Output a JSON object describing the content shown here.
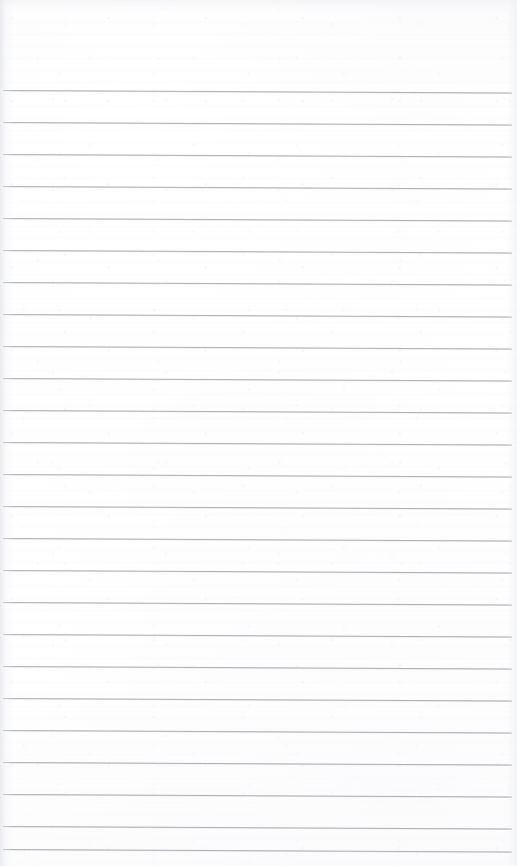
{
  "document": {
    "kind": "scanned-paper",
    "title": "Blank Lined Notebook Page",
    "description": "Scan of an empty ruled notebook page with no handwriting or printed text",
    "page_width": 517,
    "page_height": 866,
    "content_text": "",
    "paper_color": "#fefefe",
    "rule_color": "#9ea2a8",
    "edge_shadow_color": "#e4e5e9"
  },
  "ruling": {
    "line_count": 24,
    "first_line_y": 90,
    "line_spacing": 32,
    "line_thickness": 1,
    "line_left_x": 3,
    "line_right_x": 512,
    "slope_degrees": 0.28,
    "lines": [
      {
        "index": 1,
        "y": 90,
        "x1": 3,
        "x2": 512
      },
      {
        "index": 2,
        "y": 122,
        "x1": 3,
        "x2": 512
      },
      {
        "index": 3,
        "y": 154,
        "x1": 3,
        "x2": 512
      },
      {
        "index": 4,
        "y": 186,
        "x1": 3,
        "x2": 512
      },
      {
        "index": 5,
        "y": 218,
        "x1": 3,
        "x2": 512
      },
      {
        "index": 6,
        "y": 250,
        "x1": 3,
        "x2": 512
      },
      {
        "index": 7,
        "y": 282,
        "x1": 3,
        "x2": 512
      },
      {
        "index": 8,
        "y": 314,
        "x1": 3,
        "x2": 512
      },
      {
        "index": 9,
        "y": 346,
        "x1": 3,
        "x2": 512
      },
      {
        "index": 10,
        "y": 378,
        "x1": 3,
        "x2": 512
      },
      {
        "index": 11,
        "y": 410,
        "x1": 3,
        "x2": 512
      },
      {
        "index": 12,
        "y": 442,
        "x1": 3,
        "x2": 512
      },
      {
        "index": 13,
        "y": 474,
        "x1": 3,
        "x2": 512
      },
      {
        "index": 14,
        "y": 506,
        "x1": 3,
        "x2": 512
      },
      {
        "index": 15,
        "y": 538,
        "x1": 3,
        "x2": 512
      },
      {
        "index": 16,
        "y": 570,
        "x1": 3,
        "x2": 512
      },
      {
        "index": 17,
        "y": 602,
        "x1": 3,
        "x2": 512
      },
      {
        "index": 18,
        "y": 634,
        "x1": 3,
        "x2": 512
      },
      {
        "index": 19,
        "y": 666,
        "x1": 3,
        "x2": 512
      },
      {
        "index": 20,
        "y": 698,
        "x1": 3,
        "x2": 512
      },
      {
        "index": 21,
        "y": 730,
        "x1": 3,
        "x2": 512
      },
      {
        "index": 22,
        "y": 762,
        "x1": 3,
        "x2": 512
      },
      {
        "index": 23,
        "y": 794,
        "x1": 3,
        "x2": 512
      },
      {
        "index": 24,
        "y": 826,
        "x1": 3,
        "x2": 512
      },
      {
        "index": 25,
        "y": 849,
        "x1": 3,
        "x2": 512
      }
    ]
  },
  "margins": {
    "top_blank_height": 90,
    "bottom_blank_height": 17,
    "left_edge_shadow_width": 14,
    "right_edge_shadow_width": 10
  }
}
